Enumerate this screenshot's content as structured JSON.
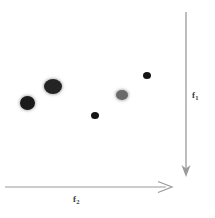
{
  "figure": {
    "width": 215,
    "height": 218,
    "background": "#ffffff",
    "type": "scatter-diagram"
  },
  "axes": {
    "vertical": {
      "label_main": "f",
      "label_sub": "1",
      "direction": "down",
      "color": "#9a9a9a",
      "x": 186,
      "y_start": 12,
      "y_end": 176
    },
    "horizontal": {
      "label_main": "f",
      "label_sub": "2",
      "direction": "right",
      "color": "#9a9a9a",
      "y": 187,
      "x_start": 5,
      "x_end": 172
    }
  },
  "chart_data": {
    "type": "scatter",
    "title": "",
    "xlabel": "f2",
    "ylabel": "f1",
    "grid": false,
    "legend": null,
    "note": "Vertical axis f1 points downward; horizontal axis f2 points rightward. Marker sizes vary.",
    "points": [
      {
        "name": "blob-1",
        "cx": 27,
        "cy": 103,
        "rx": 7.5,
        "ry": 7.0,
        "color": "#1a1a1a",
        "halo": true
      },
      {
        "name": "blob-2",
        "cx": 53,
        "cy": 86,
        "rx": 9.0,
        "ry": 7.5,
        "color": "#242424",
        "halo": true
      },
      {
        "name": "blob-3",
        "cx": 95,
        "cy": 115,
        "rx": 4.0,
        "ry": 3.5,
        "color": "#151515",
        "halo": false
      },
      {
        "name": "blob-4",
        "cx": 122,
        "cy": 95,
        "rx": 6.0,
        "ry": 5.0,
        "color": "#6a6a6a",
        "halo": true
      },
      {
        "name": "blob-5",
        "cx": 147,
        "cy": 75,
        "rx": 4.0,
        "ry": 3.5,
        "color": "#151515",
        "halo": false
      }
    ]
  }
}
